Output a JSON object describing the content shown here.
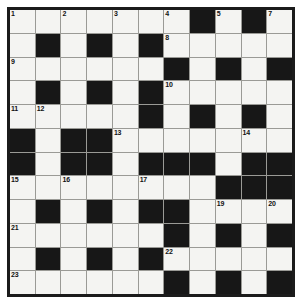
{
  "puzzle": {
    "type": "crossword-grid",
    "columns": 11,
    "rows": 12,
    "colors": {
      "block": "#171717",
      "cell": "#f4f4f2",
      "gridline": "#9a9a96",
      "border": "#1b1b1b",
      "number": "#111111",
      "page_background": "#ffffff"
    },
    "legend": {
      "W": "white letter cell",
      "B": "black blocked cell"
    },
    "grid": [
      [
        "W",
        "W",
        "W",
        "W",
        "W",
        "W",
        "W",
        "B",
        "W",
        "B",
        "W"
      ],
      [
        "W",
        "B",
        "W",
        "B",
        "W",
        "B",
        "W",
        "W",
        "W",
        "W",
        "W"
      ],
      [
        "W",
        "W",
        "W",
        "W",
        "W",
        "W",
        "B",
        "W",
        "B",
        "W",
        "B"
      ],
      [
        "W",
        "B",
        "W",
        "B",
        "W",
        "B",
        "W",
        "W",
        "W",
        "W",
        "W"
      ],
      [
        "W",
        "W",
        "W",
        "W",
        "W",
        "B",
        "W",
        "B",
        "W",
        "B",
        "W"
      ],
      [
        "B",
        "W",
        "B",
        "B",
        "W",
        "W",
        "W",
        "W",
        "W",
        "W",
        "W"
      ],
      [
        "B",
        "W",
        "B",
        "B",
        "W",
        "B",
        "B",
        "B",
        "W",
        "B",
        "B"
      ],
      [
        "W",
        "W",
        "W",
        "W",
        "W",
        "W",
        "W",
        "W",
        "B",
        "B",
        "B"
      ],
      [
        "W",
        "B",
        "W",
        "B",
        "W",
        "B",
        "B",
        "W",
        "W",
        "W",
        "W"
      ],
      [
        "W",
        "W",
        "W",
        "W",
        "W",
        "W",
        "B",
        "W",
        "B",
        "W",
        "B"
      ],
      [
        "W",
        "B",
        "W",
        "B",
        "W",
        "B",
        "W",
        "W",
        "W",
        "W",
        "W"
      ],
      [
        "W",
        "W",
        "W",
        "W",
        "W",
        "W",
        "B",
        "W",
        "B",
        "W",
        "B"
      ]
    ],
    "numbers": [
      {
        "row": 1,
        "col": 1,
        "label": "1"
      },
      {
        "row": 1,
        "col": 3,
        "label": "2"
      },
      {
        "row": 1,
        "col": 5,
        "label": "3"
      },
      {
        "row": 1,
        "col": 7,
        "label": "4"
      },
      {
        "row": 1,
        "col": 9,
        "label": "5"
      },
      {
        "row": 1,
        "col": 11,
        "label": "7"
      },
      {
        "row": 2,
        "col": 7,
        "label": "8"
      },
      {
        "row": 3,
        "col": 1,
        "label": "9"
      },
      {
        "row": 4,
        "col": 7,
        "label": "10"
      },
      {
        "row": 5,
        "col": 1,
        "label": "11"
      },
      {
        "row": 5,
        "col": 2,
        "label": "12"
      },
      {
        "row": 6,
        "col": 5,
        "label": "13"
      },
      {
        "row": 6,
        "col": 10,
        "label": "14"
      },
      {
        "row": 8,
        "col": 1,
        "label": "15"
      },
      {
        "row": 8,
        "col": 3,
        "label": "16"
      },
      {
        "row": 8,
        "col": 6,
        "label": "17"
      },
      {
        "row": 9,
        "col": 7,
        "label": "18"
      },
      {
        "row": 9,
        "col": 9,
        "label": "19"
      },
      {
        "row": 9,
        "col": 11,
        "label": "20"
      },
      {
        "row": 10,
        "col": 1,
        "label": "21"
      },
      {
        "row": 11,
        "col": 7,
        "label": "22"
      },
      {
        "row": 12,
        "col": 1,
        "label": "23"
      },
      {
        "row": 12,
        "col": 7,
        "label": "24"
      }
    ],
    "extra_numbers": [
      {
        "row": 1,
        "col": 8,
        "label": "6"
      }
    ]
  }
}
